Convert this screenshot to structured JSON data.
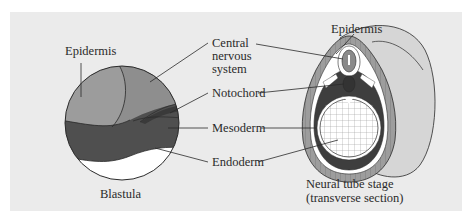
{
  "figure": {
    "panel_color": "#ebebeb",
    "left": {
      "caption": "Blastula",
      "labels": {
        "epidermis": "Epidermis"
      }
    },
    "center_labels": {
      "cns_line1": "Central",
      "cns_line2": "nervous",
      "cns_line3": "system",
      "notochord": "Notochord",
      "mesoderm": "Mesoderm",
      "endoderm": "Endoderm"
    },
    "right": {
      "caption_line1": "Neural tube stage",
      "caption_line2": "(transverse section)",
      "labels": {
        "epidermis": "Epidermis"
      }
    },
    "colors": {
      "epidermis": "#9a9a9a",
      "cns": "#8a8a8a",
      "mesoderm": "#4a4a4a",
      "notochord": "#3a3a3a",
      "endoderm": "#ffffff",
      "outline": "#2a2a2a"
    }
  }
}
